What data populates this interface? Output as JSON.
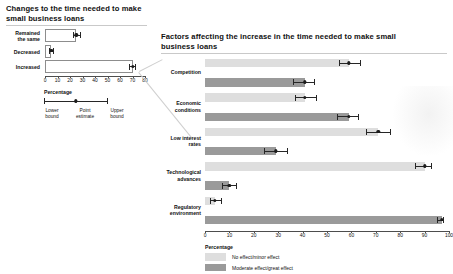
{
  "left": {
    "title": "Changes to the time needed to make small business loans",
    "axis_label": "Percentage",
    "ticks": [
      "0",
      "10",
      "20",
      "30",
      "40",
      "50",
      "60",
      "70",
      "80"
    ],
    "legend": {
      "lower": "Lower\nbound",
      "lower_l1": "Lower",
      "lower_l2": "bound",
      "point_l1": "Point",
      "point_l2": "estimate",
      "upper_l1": "Upper",
      "upper_l2": "bound"
    },
    "categories": [
      {
        "label_l1": "Remained",
        "label_l2": "the same"
      },
      {
        "label_l1": "Decreased",
        "label_l2": ""
      },
      {
        "label_l1": "Increased",
        "label_l2": ""
      }
    ]
  },
  "right": {
    "title": "Factors affecting the increase in the time needed to make small business loans",
    "axis_label": "Percentage",
    "ticks": [
      "0",
      "10",
      "20",
      "30",
      "40",
      "50",
      "60",
      "70",
      "80",
      "90",
      "100"
    ],
    "legend": [
      {
        "label": "No effect/minor effect",
        "color": "#dedede"
      },
      {
        "label": "Moderate effect/great effect",
        "color": "#9a9a9a"
      }
    ],
    "categories": [
      {
        "label_l1": "Competition",
        "label_l2": ""
      },
      {
        "label_l1": "Economic",
        "label_l2": "conditions"
      },
      {
        "label_l1": "Low interest",
        "label_l2": "rates"
      },
      {
        "label_l1": "Technological",
        "label_l2": "advances"
      },
      {
        "label_l1": "Regulatory",
        "label_l2": "environment"
      }
    ]
  },
  "chart_data": [
    {
      "type": "bar",
      "id": "left-chart",
      "title": "Changes to the time needed to make small business loans",
      "xlabel": "Percentage",
      "ylabel": "",
      "xlim": [
        0,
        80
      ],
      "orientation": "horizontal",
      "grid": false,
      "error_bars": "95% confidence interval (lower bound, point estimate, upper bound)",
      "categories": [
        "Remained the same",
        "Decreased",
        "Increased"
      ],
      "values": [
        25,
        5,
        70
      ],
      "lower": [
        22,
        3,
        67
      ],
      "upper": [
        29,
        7,
        73
      ],
      "bar_style": "white fill with gray outline"
    },
    {
      "type": "bar",
      "id": "right-chart",
      "title": "Factors affecting the increase in the time needed to make small business loans",
      "xlabel": "Percentage",
      "ylabel": "",
      "xlim": [
        0,
        100
      ],
      "orientation": "horizontal",
      "grid": false,
      "legend_position": "bottom",
      "error_bars": "95% confidence interval (lower bound, point estimate, upper bound)",
      "categories": [
        "Competition",
        "Economic conditions",
        "Low interest rates",
        "Technological advances",
        "Regulatory environment"
      ],
      "series": [
        {
          "name": "No effect/minor effect",
          "color": "#dedede",
          "values": [
            59,
            41,
            71,
            90,
            4
          ],
          "lower": [
            55,
            37,
            66,
            86,
            2
          ],
          "upper": [
            64,
            46,
            76,
            93,
            7
          ]
        },
        {
          "name": "Moderate effect/great effect",
          "color": "#9a9a9a",
          "values": [
            41,
            59,
            29,
            10,
            97
          ],
          "lower": [
            36,
            54,
            24,
            7,
            95
          ],
          "upper": [
            45,
            63,
            34,
            13,
            98
          ]
        }
      ]
    }
  ]
}
